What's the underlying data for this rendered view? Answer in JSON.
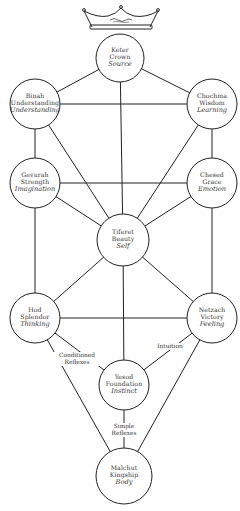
{
  "diagram": {
    "type": "tree-of-life",
    "crown_icon": "crown-icon",
    "colors": {
      "line": "#222222",
      "fill": "#ffffff",
      "text": "#333333"
    },
    "nodes": [
      {
        "id": "keter",
        "hebrew": "Keter",
        "english": "Crown",
        "psych": "Source",
        "cx": 120,
        "cy": 58,
        "r": 24
      },
      {
        "id": "binah",
        "hebrew": "Binah",
        "english": "Understanding",
        "psych": "Understanding",
        "cx": 35,
        "cy": 104,
        "r": 25
      },
      {
        "id": "chochma",
        "hebrew": "Chochma",
        "english": "Wisdom",
        "psych": "Learning",
        "cx": 212,
        "cy": 104,
        "r": 25
      },
      {
        "id": "gevurah",
        "hebrew": "Gevurah",
        "english": "Strength",
        "psych": "Imagination",
        "cx": 35,
        "cy": 183,
        "r": 25
      },
      {
        "id": "chesed",
        "hebrew": "Chesed",
        "english": "Grace",
        "psych": "Emotion",
        "cx": 212,
        "cy": 183,
        "r": 25
      },
      {
        "id": "tiferet",
        "hebrew": "Tiferet",
        "english": "Beauty",
        "psych": "Self",
        "cx": 123,
        "cy": 240,
        "r": 26
      },
      {
        "id": "hod",
        "hebrew": "Hod",
        "english": "Splendor",
        "psych": "Thinking",
        "cx": 35,
        "cy": 318,
        "r": 25
      },
      {
        "id": "netzach",
        "hebrew": "Netzach",
        "english": "Victory",
        "psych": "Feeling",
        "cx": 212,
        "cy": 318,
        "r": 25
      },
      {
        "id": "yesod",
        "hebrew": "Yesod",
        "english": "Foundation",
        "psych": "Instinct",
        "cx": 124,
        "cy": 385,
        "r": 25
      },
      {
        "id": "malchut",
        "hebrew": "Malchut",
        "english": "Kingship",
        "psych": "Body",
        "cx": 124,
        "cy": 476,
        "r": 28
      }
    ],
    "edges": [
      {
        "from": "keter",
        "to": "binah"
      },
      {
        "from": "keter",
        "to": "chochma"
      },
      {
        "from": "keter",
        "to": "tiferet"
      },
      {
        "from": "binah",
        "to": "chochma"
      },
      {
        "from": "binah",
        "to": "gevurah"
      },
      {
        "from": "binah",
        "to": "tiferet"
      },
      {
        "from": "chochma",
        "to": "chesed"
      },
      {
        "from": "chochma",
        "to": "tiferet"
      },
      {
        "from": "gevurah",
        "to": "chesed"
      },
      {
        "from": "gevurah",
        "to": "tiferet"
      },
      {
        "from": "gevurah",
        "to": "hod"
      },
      {
        "from": "chesed",
        "to": "tiferet"
      },
      {
        "from": "chesed",
        "to": "netzach"
      },
      {
        "from": "tiferet",
        "to": "hod"
      },
      {
        "from": "tiferet",
        "to": "netzach"
      },
      {
        "from": "tiferet",
        "to": "yesod"
      },
      {
        "from": "hod",
        "to": "netzach"
      },
      {
        "from": "hod",
        "to": "yesod",
        "label": "Conditioned Reflexes"
      },
      {
        "from": "netzach",
        "to": "yesod",
        "label": "Intuition"
      },
      {
        "from": "hod",
        "to": "malchut"
      },
      {
        "from": "netzach",
        "to": "malchut"
      },
      {
        "from": "yesod",
        "to": "malchut",
        "label": "Simple Reflexes"
      }
    ],
    "edge_labels": {
      "conditioned_reflexes": [
        "Conditioned",
        "Reflexes"
      ],
      "intuition": "Intuition",
      "simple_reflexes": [
        "Simple",
        "Reflexes"
      ]
    }
  }
}
